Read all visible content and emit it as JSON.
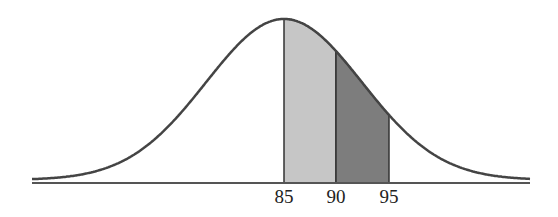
{
  "chart_data": {
    "type": "area",
    "title": "",
    "xlabel": "",
    "ylabel": "",
    "mean": 85,
    "tick_labels": [
      "85",
      "90",
      "95"
    ],
    "x_ticks": [
      85,
      90,
      95
    ],
    "shaded_regions": [
      {
        "from": 85,
        "to": 90,
        "color": "#c4c4c4"
      },
      {
        "from": 90,
        "to": 95,
        "color": "#7a7a7a"
      }
    ],
    "grid": false,
    "legend": null
  },
  "labels": {
    "t85": "85",
    "t90": "90",
    "t95": "95"
  },
  "colors": {
    "curve": "#444444",
    "axis": "#555555",
    "light": "#c6c6c6",
    "dark": "#7d7d7d"
  }
}
